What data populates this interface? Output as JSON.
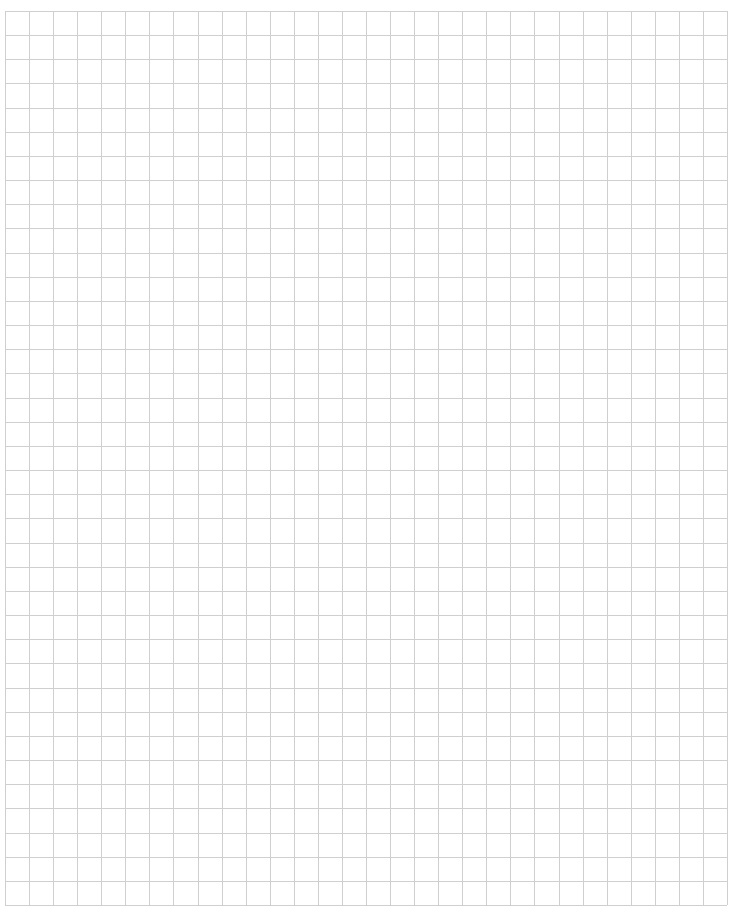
{
  "page": {
    "type": "graph-paper",
    "columns": 30,
    "rows": 37,
    "line_color": "#cfcfcf",
    "background_color": "#ffffff"
  }
}
